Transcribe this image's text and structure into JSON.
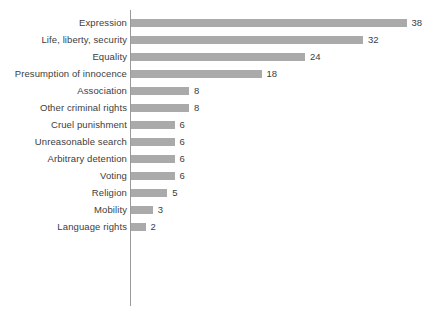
{
  "chart_data": {
    "type": "bar",
    "orientation": "horizontal",
    "title": "",
    "subtitle": "",
    "xlabel": "",
    "ylabel": "",
    "grid": false,
    "legend": false,
    "legend_position": "none",
    "xlim": [
      0,
      38
    ],
    "value_labels": true,
    "bar_color": "#aaaaaa",
    "axis_color": "#9a9a9a",
    "text_color": "#3d3d3d",
    "categories": [
      "Expression",
      "Life, liberty, security",
      "Equality",
      "Presumption of innocence",
      "Association",
      "Other criminal rights",
      "Cruel punishment",
      "Unreasonable search",
      "Arbitrary detention",
      "Voting",
      "Religion",
      "Mobility",
      "Language rights"
    ],
    "values": [
      38,
      32,
      24,
      18,
      8,
      8,
      6,
      6,
      6,
      6,
      5,
      3,
      2
    ],
    "bars": [
      {
        "label": "Expression",
        "value": 38,
        "value_text": "38"
      },
      {
        "label": "Life, liberty, security",
        "value": 32,
        "value_text": "32"
      },
      {
        "label": "Equality",
        "value": 24,
        "value_text": "24"
      },
      {
        "label": "Presumption of innocence",
        "value": 18,
        "value_text": "18"
      },
      {
        "label": "Association",
        "value": 8,
        "value_text": "8"
      },
      {
        "label": "Other criminal rights",
        "value": 8,
        "value_text": "8"
      },
      {
        "label": "Cruel punishment",
        "value": 6,
        "value_text": "6"
      },
      {
        "label": "Unreasonable search",
        "value": 6,
        "value_text": "6"
      },
      {
        "label": "Arbitrary detention",
        "value": 6,
        "value_text": "6"
      },
      {
        "label": "Voting",
        "value": 6,
        "value_text": "6"
      },
      {
        "label": "Religion",
        "value": 5,
        "value_text": "5"
      },
      {
        "label": "Mobility",
        "value": 3,
        "value_text": "3"
      },
      {
        "label": "Language rights",
        "value": 2,
        "value_text": "2"
      }
    ]
  }
}
